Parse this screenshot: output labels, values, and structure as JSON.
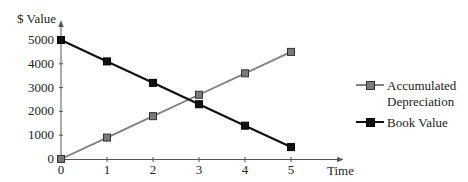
{
  "chart_data": {
    "type": "line",
    "title": "",
    "xlabel": "Time",
    "ylabel": "$ Value",
    "x": [
      0,
      1,
      2,
      3,
      4,
      5
    ],
    "x_tick_labels": [
      "0",
      "1",
      "2",
      "3",
      "4",
      "5"
    ],
    "y_tick_labels": [
      "0",
      "1000",
      "2000",
      "3000",
      "4000",
      "5000"
    ],
    "y_ticks": [
      0,
      1000,
      2000,
      3000,
      4000,
      5000
    ],
    "xlim": [
      0,
      5.6
    ],
    "ylim": [
      0,
      5400
    ],
    "grid": false,
    "legend_position": "right",
    "series": [
      {
        "name": "Accumulated Depreciation",
        "values": [
          0,
          900,
          1800,
          2700,
          3600,
          4500
        ],
        "line_color": "#808080",
        "marker": "square",
        "marker_fill": "#7a7a7a"
      },
      {
        "name": "Book Value",
        "values": [
          5000,
          4100,
          3200,
          2300,
          1400,
          500
        ],
        "line_color": "#111111",
        "marker": "square",
        "marker_fill": "#111111"
      }
    ]
  },
  "legend": {
    "items": [
      {
        "label_line1": "Accumulated",
        "label_line2": "Depreciation"
      },
      {
        "label_line1": "Book Value",
        "label_line2": ""
      }
    ]
  }
}
